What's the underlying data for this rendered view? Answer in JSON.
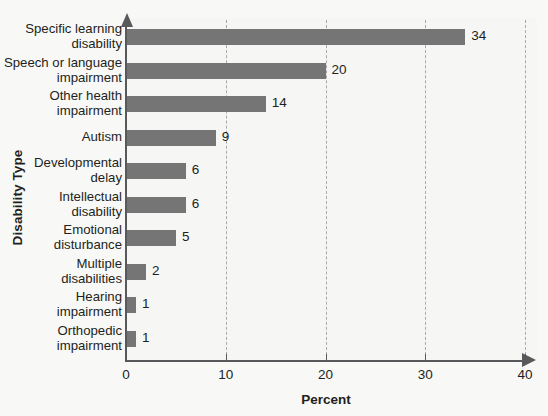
{
  "chart_data": {
    "type": "bar",
    "orientation": "horizontal",
    "title": "",
    "xlabel": "Percent",
    "ylabel": "Disability Type",
    "categories": [
      "Specific learning disability",
      "Speech or language impairment",
      "Other health impairment",
      "Autism",
      "Developmental delay",
      "Intellectual disability",
      "Emotional disturbance",
      "Multiple disabilities",
      "Hearing impairment",
      "Orthopedic impairment"
    ],
    "category_lines": [
      [
        "Specific learning",
        "disability"
      ],
      [
        "Speech or language",
        "impairment"
      ],
      [
        "Other health",
        "impairment"
      ],
      [
        "Autism"
      ],
      [
        "Developmental",
        "delay"
      ],
      [
        "Intellectual",
        "disability"
      ],
      [
        "Emotional",
        "disturbance"
      ],
      [
        "Multiple",
        "disabilities"
      ],
      [
        "Hearing",
        "impairment"
      ],
      [
        "Orthopedic",
        "impairment"
      ]
    ],
    "values": [
      34,
      20,
      14,
      9,
      6,
      6,
      5,
      2,
      1,
      1
    ],
    "value_labels": [
      "34",
      "20",
      "14",
      "9",
      "6",
      "6",
      "5",
      "2",
      "1",
      "1"
    ],
    "xlim": [
      0,
      40
    ],
    "xticks": [
      0,
      10,
      20,
      30,
      40
    ],
    "xtick_labels": [
      "0",
      "10",
      "20",
      "30",
      "40"
    ],
    "grid": "vertical-dashed",
    "legend": "none",
    "bar_color": "#757575",
    "axis_color": "#58595b",
    "grid_color": "#a9a9a9",
    "background_color": "#f6f6f5",
    "text_color": "#231f20"
  }
}
